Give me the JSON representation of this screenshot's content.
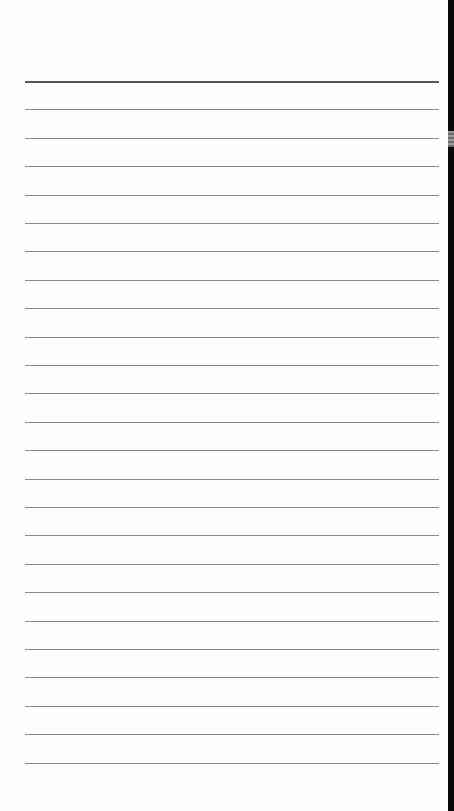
{
  "document": {
    "type": "lined-notepad-page",
    "line_count": 25,
    "first_line_y": 81,
    "line_spacing": 28.4,
    "line_left": 25,
    "line_width": 414
  },
  "edge_strip": {
    "color": "#0a0a0a",
    "grip_y": 131
  },
  "colors": {
    "paper": "#fefefe",
    "rule": "#8a8a8a",
    "top_rule": "#555555"
  }
}
